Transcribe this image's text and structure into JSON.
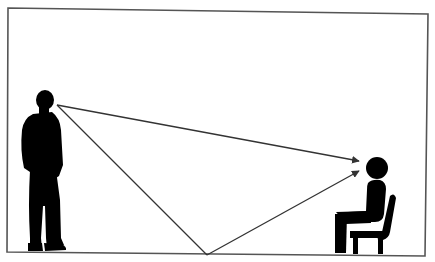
{
  "diagram": {
    "colors": {
      "background": "#ffffff",
      "frame": "#444444",
      "silhouette": "#000000",
      "line": "#333333"
    },
    "elements": {
      "standing_person": "standing-person-silhouette",
      "seated_person": "seated-person-on-chair-icon",
      "direct_ray": "direct-line-of-sight-arrow",
      "reflected_ray": "floor-reflection-path-arrow"
    }
  }
}
